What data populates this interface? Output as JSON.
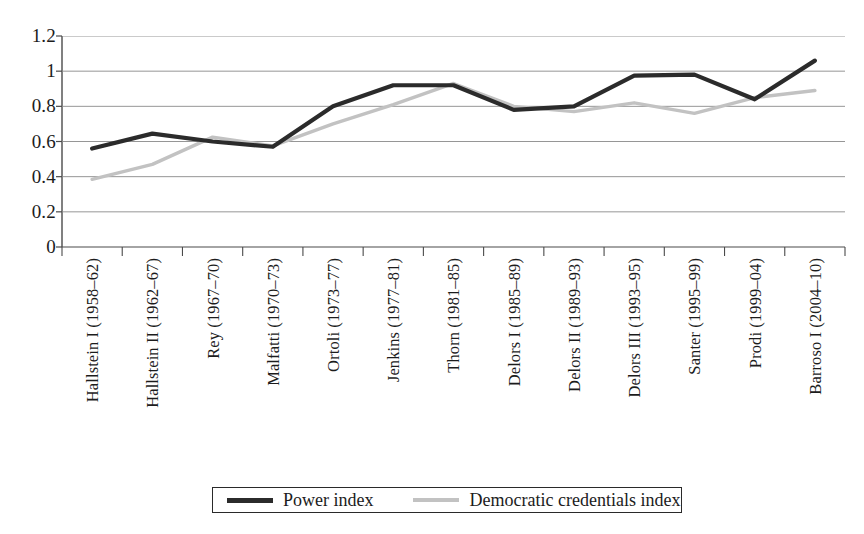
{
  "chart_data": {
    "type": "line",
    "title": "",
    "subtitle": "",
    "xlabel": "",
    "ylabel": "",
    "ylim": [
      0,
      1.2
    ],
    "ytick_values": [
      1.2,
      1,
      0.8,
      0.6,
      0.4,
      0.2,
      0
    ],
    "ytick_labels": [
      "1.2",
      "1",
      "0.8",
      "0.6",
      "0.4",
      "0.2",
      "0"
    ],
    "grid": "horizontal",
    "legend_position": "bottom-center",
    "categories": [
      "Hallstein I (1958–62)",
      "Hallstein II (1962–67)",
      "Rey (1967–70)",
      "Malfatti (1970–73)",
      "Ortoli (1973–77)",
      "Jenkins (1977–81)",
      "Thorn (1981–85)",
      "Delors I (1985–89)",
      "Delors II (1989–93)",
      "Delors III (1993–95)",
      "Santer (1995–99)",
      "Prodi (1999–04)",
      "Barroso I (2004–10)"
    ],
    "series": [
      {
        "name": "Power index",
        "color": "#2b2b2b",
        "values": [
          0.56,
          0.645,
          0.6,
          0.57,
          0.8,
          0.92,
          0.92,
          0.78,
          0.8,
          0.975,
          0.98,
          0.84,
          1.06
        ]
      },
      {
        "name": "Democratic credentials index",
        "color": "#c2c2c2",
        "values": [
          0.385,
          0.47,
          0.625,
          0.575,
          0.7,
          0.81,
          0.93,
          0.8,
          0.77,
          0.82,
          0.76,
          0.85,
          0.89
        ]
      }
    ]
  },
  "legend": {
    "items": [
      {
        "label": "Power index"
      },
      {
        "label": "Democratic credentials index"
      }
    ]
  },
  "colors": {
    "power_index": "#2b2b2b",
    "democratic_credentials_index": "#c2c2c2",
    "gridline": "#8a8a8a",
    "axis": "#4a4a4a",
    "text": "#1c1c1c",
    "background": "#ffffff"
  }
}
